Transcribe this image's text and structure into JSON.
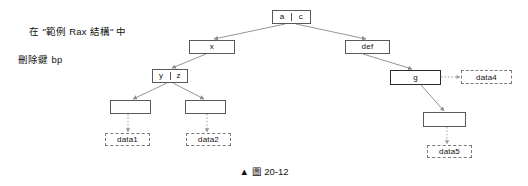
{
  "figure": {
    "annotation_line1": "在 \"範例 Rax 結構\" 中",
    "annotation_line2": "刪除鍵 bp",
    "caption": "▲ 圖 20-12",
    "colors": {
      "node_border": "#59595b",
      "bold_node_border": "#2b2b2b",
      "data_border": "#7a7a7c",
      "edge": "#8a8a8c",
      "text": "#111111",
      "background": "#ffffff"
    }
  },
  "nodes": [
    {
      "id": "root",
      "label": "a|c",
      "cells": [
        "a",
        "c"
      ],
      "x": 272,
      "y": 10,
      "w": 39,
      "h": 14,
      "style": "split"
    },
    {
      "id": "x",
      "label": "x",
      "cells": [
        "x"
      ],
      "x": 189,
      "y": 40,
      "w": 46,
      "h": 14,
      "style": "plain"
    },
    {
      "id": "yz",
      "label": "y|z",
      "cells": [
        "y",
        "z"
      ],
      "x": 152,
      "y": 69,
      "w": 36,
      "h": 14,
      "style": "split"
    },
    {
      "id": "leaf-left",
      "label": "",
      "cells": [
        ""
      ],
      "x": 110,
      "y": 100,
      "w": 41,
      "h": 14,
      "style": "empty"
    },
    {
      "id": "leaf-mid",
      "label": "",
      "cells": [
        ""
      ],
      "x": 185,
      "y": 100,
      "w": 41,
      "h": 14,
      "style": "empty"
    },
    {
      "id": "def",
      "label": "def",
      "cells": [
        "def"
      ],
      "x": 345,
      "y": 40,
      "w": 45,
      "h": 14,
      "style": "plain"
    },
    {
      "id": "g",
      "label": "g",
      "cells": [
        "g"
      ],
      "x": 390,
      "y": 70,
      "w": 51,
      "h": 15,
      "style": "bold"
    },
    {
      "id": "leaf-right",
      "label": "",
      "cells": [
        ""
      ],
      "x": 423,
      "y": 112,
      "w": 43,
      "h": 15,
      "style": "empty"
    }
  ],
  "data_nodes": [
    {
      "id": "data1",
      "label": "data1",
      "x": 105,
      "y": 133,
      "w": 45,
      "h": 13
    },
    {
      "id": "data2",
      "label": "data2",
      "x": 186,
      "y": 133,
      "w": 45,
      "h": 13
    },
    {
      "id": "data4",
      "label": "data4",
      "x": 461,
      "y": 70,
      "w": 51,
      "h": 14
    },
    {
      "id": "data5",
      "label": "data5",
      "x": 427,
      "y": 145,
      "w": 45,
      "h": 13
    }
  ],
  "edges": [
    {
      "id": "root-to-x",
      "from": "root",
      "to": "x",
      "kind": "solid"
    },
    {
      "id": "root-to-def",
      "from": "root",
      "to": "def",
      "kind": "solid"
    },
    {
      "id": "x-to-yz",
      "from": "x",
      "to": "yz",
      "kind": "solid"
    },
    {
      "id": "yz-to-leaf-left",
      "from": "yz",
      "to": "leaf-left",
      "kind": "solid"
    },
    {
      "id": "yz-to-leaf-mid",
      "from": "yz",
      "to": "leaf-mid",
      "kind": "solid"
    },
    {
      "id": "leaf-left-to-data1",
      "from": "leaf-left",
      "to": "data1",
      "kind": "dotted"
    },
    {
      "id": "leaf-mid-to-data2",
      "from": "leaf-mid",
      "to": "data2",
      "kind": "dotted"
    },
    {
      "id": "def-to-g",
      "from": "def",
      "to": "g",
      "kind": "solid"
    },
    {
      "id": "g-to-data4",
      "from": "g",
      "to": "data4",
      "kind": "dotted"
    },
    {
      "id": "g-to-leaf-right",
      "from": "g",
      "to": "leaf-right",
      "kind": "solid"
    },
    {
      "id": "leaf-right-to-data5",
      "from": "leaf-right",
      "to": "data5",
      "kind": "dotted"
    }
  ]
}
